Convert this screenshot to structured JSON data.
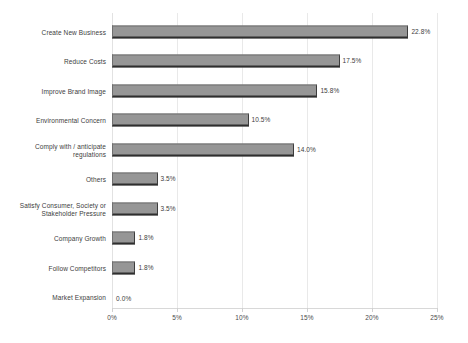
{
  "chart_data": {
    "type": "bar",
    "orientation": "horizontal",
    "title": "",
    "subtitle": "",
    "xlabel": "",
    "ylabel": "",
    "xlim": [
      0,
      25
    ],
    "grid": true,
    "legend": "none",
    "value_suffix": "%",
    "categories": [
      "Create New Business",
      "Reduce Costs",
      "Improve Brand Image",
      "Environmental Concern",
      "Comply with / anticipate\nregulations",
      "Others",
      "Satisfy Consumer, Society or\nStakeholder Pressure",
      "Company Growth",
      "Follow Competitors",
      "Market Expansion"
    ],
    "values": [
      22.8,
      17.5,
      15.8,
      10.5,
      14.0,
      3.5,
      3.5,
      1.8,
      1.8,
      0.0
    ],
    "value_labels": [
      "22.8%",
      "17.5%",
      "15.8%",
      "10.5%",
      "14.0%",
      "3.5%",
      "3.5%",
      "1.8%",
      "1.8%",
      "0.0%"
    ],
    "xticks": [
      0,
      5,
      10,
      15,
      20,
      25
    ],
    "xtick_labels": [
      "0%",
      "5%",
      "10%",
      "15%",
      "20%",
      "25%"
    ],
    "colors": {
      "bar_fill": "#969696",
      "bar_border": "#6f6f6f",
      "bar_shadow": "#2e2e2e",
      "gridline": "#e9e9e9",
      "axis": "#d8d8d8",
      "text": "#3d3d3d",
      "background": "#ffffff"
    }
  }
}
